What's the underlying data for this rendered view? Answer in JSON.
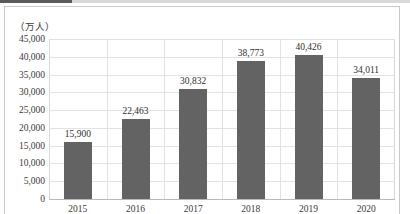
{
  "chart_data": {
    "type": "bar",
    "title": "",
    "subtitle": "",
    "unit_label": "（万人）",
    "xlabel": "",
    "ylabel": "",
    "categories": [
      "2015",
      "2016",
      "2017",
      "2018",
      "2019",
      "2020"
    ],
    "values": [
      15900,
      22463,
      30832,
      38773,
      40426,
      34011
    ],
    "value_labels": [
      "15,900",
      "22,463",
      "30,832",
      "38,773",
      "40,426",
      "34,011"
    ],
    "ylim": [
      0,
      45000
    ],
    "ytick_values": [
      45000,
      40000,
      35000,
      30000,
      25000,
      20000,
      15000,
      10000,
      5000,
      0
    ],
    "ytick_labels": [
      "45,000",
      "40,000",
      "35,000",
      "30,000",
      "25,000",
      "20,000",
      "15,000",
      "10,000",
      "5,000",
      "0"
    ],
    "grid": true,
    "legend": false,
    "legend_position": "none",
    "series": [
      {
        "name": "",
        "color": "#636363",
        "values": [
          15900,
          22463,
          30832,
          38773,
          40426,
          34011
        ]
      }
    ]
  },
  "colors": {
    "bar": "#636363",
    "gridline": "#e2e2e2",
    "plot_border": "#d6d6d6",
    "frame_border": "#c9c9c9",
    "text": "#3a3a3a",
    "top_strip": "#5b5b5b"
  }
}
